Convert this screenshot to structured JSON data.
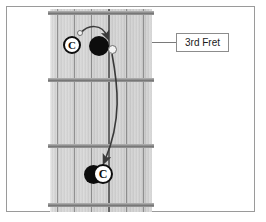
{
  "figure": {
    "kind": "guitar-fretboard-diagram",
    "title": "",
    "background_color": "#ffffff",
    "border_color": "#9a9a9a"
  },
  "callout": {
    "label": "3rd Fret",
    "leader_line": true
  },
  "fretboard": {
    "fret_count": 4,
    "string_count": 6,
    "fret_positions_y": [
      11,
      78,
      144,
      203
    ],
    "wood_color": "#d2d2d2",
    "fret_wire_color": "#808080"
  },
  "markers": [
    {
      "id": "c-note-upper",
      "type": "c-circle",
      "label": "C",
      "string": 2,
      "fret_space": 1,
      "x": 72,
      "y": 45,
      "radius": 9
    },
    {
      "id": "target-dot-upper",
      "type": "filled-dot",
      "label": "",
      "string": 4,
      "fret_space": 1,
      "x": 99,
      "y": 46,
      "radius": 10
    },
    {
      "id": "origin-tick-upper",
      "type": "small-open-dot",
      "label": "",
      "x": 80,
      "y": 33,
      "radius": 3
    },
    {
      "id": "pivot-dot",
      "type": "small-open-dot",
      "label": "",
      "x": 112,
      "y": 49,
      "radius": 4
    },
    {
      "id": "target-dot-lower",
      "type": "filled-dot",
      "label": "",
      "x": 100,
      "y": 174,
      "radius": 9
    },
    {
      "id": "c-note-lower",
      "type": "c-circle",
      "label": "C",
      "x": 110,
      "y": 174,
      "radius": 10
    }
  ],
  "arrows": [
    {
      "id": "short-arrow",
      "from": "origin-tick-upper",
      "to": "target-dot-upper",
      "style": "curved",
      "color": "#3a3a3a"
    },
    {
      "id": "long-arrow",
      "from": "pivot-dot",
      "to": "target-dot-lower",
      "style": "curved",
      "color": "#3a3a3a"
    }
  ]
}
